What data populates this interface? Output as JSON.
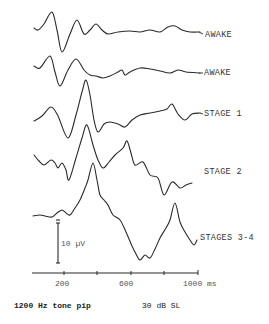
{
  "chart_data": {
    "type": "line",
    "title": "",
    "xlabel": "ms",
    "ylabel": "",
    "x_ticks": [
      200,
      600,
      1000
    ],
    "x_tick_labels": [
      "200",
      "600",
      "1000 ms"
    ],
    "x_range": [
      0,
      1000
    ],
    "minor_ticks": [
      200,
      400,
      600,
      800,
      1000
    ],
    "grid": false,
    "scale_bar": {
      "label": "10 µV",
      "value_uV": 10
    },
    "series": [
      {
        "name": "AWAKE",
        "points_px": [
          [
            34,
            28
          ],
          [
            38,
            30
          ],
          [
            44,
            24
          ],
          [
            52,
            12
          ],
          [
            57,
            30
          ],
          [
            62,
            52
          ],
          [
            70,
            34
          ],
          [
            77,
            20
          ],
          [
            84,
            34
          ],
          [
            90,
            30
          ],
          [
            96,
            24
          ],
          [
            102,
            30
          ],
          [
            108,
            34
          ],
          [
            118,
            32
          ],
          [
            130,
            31
          ],
          [
            140,
            32
          ],
          [
            150,
            30
          ],
          [
            160,
            32
          ],
          [
            168,
            27
          ],
          [
            175,
            26
          ],
          [
            182,
            30
          ],
          [
            190,
            32
          ],
          [
            200,
            32
          ]
        ]
      },
      {
        "name": "AWAKE",
        "points_px": [
          [
            34,
            66
          ],
          [
            40,
            68
          ],
          [
            50,
            56
          ],
          [
            55,
            72
          ],
          [
            60,
            86
          ],
          [
            68,
            70
          ],
          [
            76,
            59
          ],
          [
            84,
            70
          ],
          [
            90,
            75
          ],
          [
            96,
            76
          ],
          [
            103,
            78
          ],
          [
            110,
            76
          ],
          [
            118,
            72
          ],
          [
            122,
            70
          ],
          [
            125,
            75
          ],
          [
            130,
            72
          ],
          [
            140,
            68
          ],
          [
            150,
            69
          ],
          [
            160,
            71
          ],
          [
            170,
            73
          ],
          [
            178,
            70
          ],
          [
            186,
            72
          ],
          [
            200,
            73
          ]
        ]
      },
      {
        "name": "STAGE 1",
        "points_px": [
          [
            34,
            121
          ],
          [
            42,
            116
          ],
          [
            51,
            107
          ],
          [
            58,
            116
          ],
          [
            68,
            138
          ],
          [
            76,
            115
          ],
          [
            82,
            92
          ],
          [
            86,
            80
          ],
          [
            90,
            95
          ],
          [
            94,
            120
          ],
          [
            98,
            132
          ],
          [
            104,
            124
          ],
          [
            110,
            122
          ],
          [
            118,
            124
          ],
          [
            125,
            127
          ],
          [
            132,
            120
          ],
          [
            140,
            115
          ],
          [
            150,
            113
          ],
          [
            160,
            111
          ],
          [
            167,
            109
          ],
          [
            172,
            104
          ],
          [
            178,
            114
          ],
          [
            185,
            120
          ],
          [
            192,
            114
          ],
          [
            200,
            113
          ]
        ]
      },
      {
        "name": "STAGE 2",
        "points_px": [
          [
            34,
            155
          ],
          [
            39,
            161
          ],
          [
            44,
            165
          ],
          [
            51,
            160
          ],
          [
            55,
            163
          ],
          [
            58,
            168
          ],
          [
            62,
            163
          ],
          [
            66,
            170
          ],
          [
            69,
            180
          ],
          [
            76,
            158
          ],
          [
            82,
            138
          ],
          [
            87,
            125
          ],
          [
            93,
            145
          ],
          [
            98,
            160
          ],
          [
            103,
            168
          ],
          [
            109,
            162
          ],
          [
            115,
            155
          ],
          [
            123,
            148
          ],
          [
            127,
            141
          ],
          [
            131,
            153
          ],
          [
            135,
            165
          ],
          [
            143,
            162
          ],
          [
            150,
            175
          ],
          [
            158,
            178
          ],
          [
            164,
            195
          ],
          [
            172,
            182
          ],
          [
            180,
            188
          ],
          [
            186,
            185
          ],
          [
            192,
            183
          ]
        ]
      },
      {
        "name": "STAGES 3-4",
        "points_px": [
          [
            33,
            216
          ],
          [
            40,
            215
          ],
          [
            45,
            216
          ],
          [
            52,
            217
          ],
          [
            57,
            213
          ],
          [
            62,
            210
          ],
          [
            66,
            213
          ],
          [
            70,
            215
          ],
          [
            75,
            208
          ],
          [
            80,
            200
          ],
          [
            85,
            188
          ],
          [
            88,
            180
          ],
          [
            93,
            163
          ],
          [
            97,
            180
          ],
          [
            100,
            195
          ],
          [
            104,
            200
          ],
          [
            108,
            205
          ],
          [
            113,
            215
          ],
          [
            120,
            220
          ],
          [
            126,
            232
          ],
          [
            132,
            246
          ],
          [
            136,
            254
          ],
          [
            140,
            260
          ],
          [
            145,
            255
          ],
          [
            150,
            258
          ],
          [
            155,
            249
          ],
          [
            160,
            238
          ],
          [
            166,
            228
          ],
          [
            170,
            220
          ],
          [
            175,
            203
          ],
          [
            180,
            222
          ],
          [
            185,
            232
          ],
          [
            190,
            240
          ],
          [
            194,
            245
          ],
          [
            197,
            240
          ]
        ]
      }
    ]
  },
  "labels": {
    "trace1": "AWAKE",
    "trace2": "AWAKE",
    "trace3": "STAGE 1",
    "trace4": "STAGE 2",
    "trace5": "STAGES 3-4",
    "scale": "10 µV",
    "tick200": "200",
    "tick600": "600",
    "tick1000": "1000 ms",
    "stimulus": "1200 Hz tone pip",
    "level": "30 dB SL"
  },
  "colors": {
    "ink": "#2a2a2a",
    "background": "#ffffff"
  }
}
